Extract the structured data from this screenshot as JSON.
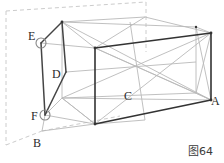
{
  "figure": {
    "caption": "图64",
    "background_color": "#ffffff",
    "solid_line_color": "#2b2b2b",
    "faint_line_color": "#b4b4b4",
    "dashed_line_color": "#cccccc",
    "vertex_marker_color": "#808080",
    "label_color": "#2b2b2b",
    "labels": [
      {
        "id": "E",
        "text": "E",
        "x": 28,
        "y": 30
      },
      {
        "id": "D",
        "text": "D",
        "x": 52,
        "y": 68
      },
      {
        "id": "F",
        "text": "F",
        "x": 31,
        "y": 110
      },
      {
        "id": "B",
        "text": "B",
        "x": 33,
        "y": 137
      },
      {
        "id": "C",
        "text": "C",
        "x": 124,
        "y": 90
      },
      {
        "id": "A",
        "text": "A",
        "x": 211,
        "y": 95
      }
    ],
    "vertex_markers": [
      {
        "id": "E",
        "cx": 41,
        "cy": 43,
        "r": 5
      },
      {
        "id": "F",
        "cx": 45,
        "cy": 115,
        "r": 5
      }
    ],
    "geometry": {
      "box_back_top_left": {
        "x": 62,
        "y": 22
      },
      "box_front_top_left": {
        "x": 95,
        "y": 48
      },
      "box_back_top_right": {
        "x": 196,
        "y": 27
      },
      "box_front_top_right": {
        "x": 211,
        "y": 33
      },
      "box_front_bottom_left": {
        "x": 95,
        "y": 124
      },
      "box_front_bottom_right": {
        "x": 211,
        "y": 100
      },
      "box_back_bottom_left": {
        "x": 62,
        "y": 98
      },
      "box_back_bottom_right": {
        "x": 196,
        "y": 93
      },
      "point_B": {
        "x": 42,
        "y": 131
      },
      "point_E": {
        "x": 41,
        "y": 43
      },
      "point_F": {
        "x": 45,
        "y": 115
      },
      "point_D": {
        "x": 66,
        "y": 72
      }
    }
  }
}
